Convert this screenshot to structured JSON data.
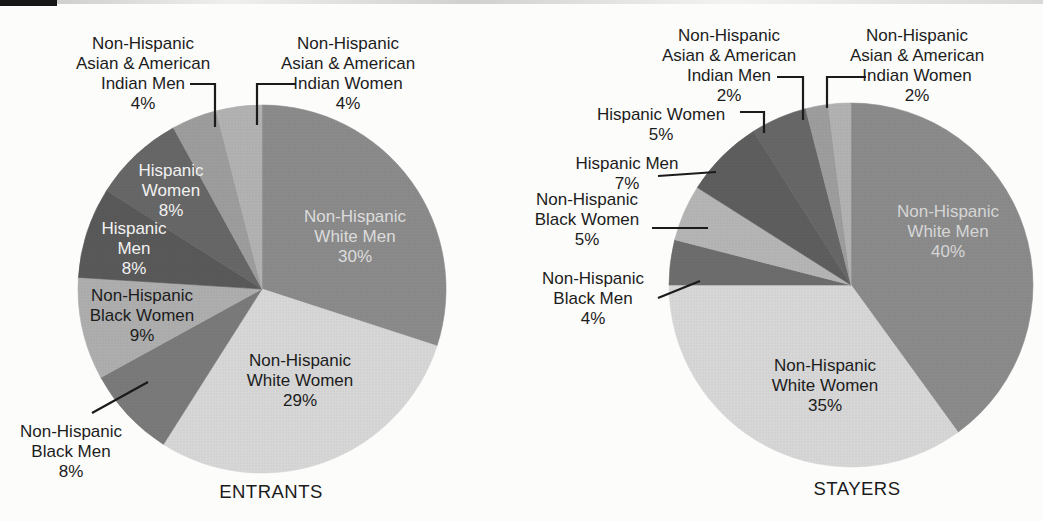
{
  "figure": {
    "description_visible_text_only": true,
    "background_color": "#fcfcfb",
    "scan_artifacts": {
      "top_left_black_bar_color": "#161616",
      "top_streak_color": "#aaaaaa"
    }
  },
  "chart_data": [
    {
      "type": "pie",
      "caption": "ENTRANTS",
      "legend": "none",
      "layout": {
        "center_x": 262,
        "center_y": 289,
        "radius": 184,
        "start_angle": 0,
        "direction": "clockwise",
        "caption_x": 271,
        "caption_y": 492
      },
      "slices": [
        {
          "category": "Non-Hispanic White Men",
          "value": 30,
          "color": "#8b8b8b",
          "label_lines": [
            "Non-Hispanic",
            "White Men",
            "30%"
          ],
          "label": {
            "placement": "inside",
            "x": 355,
            "y": 237,
            "color": "#dcdcdc"
          }
        },
        {
          "category": "Non-Hispanic White Women",
          "value": 29,
          "color": "#d7d7d7",
          "label_lines": [
            "Non-Hispanic",
            "White Women",
            "29%"
          ],
          "label": {
            "placement": "inside",
            "x": 300,
            "y": 381,
            "color": "#1c1c1c"
          }
        },
        {
          "category": "Non-Hispanic Black Men",
          "value": 8,
          "color": "#7a7a7a",
          "label_lines": [
            "Non-Hispanic",
            "Black Men",
            "8%"
          ],
          "label": {
            "placement": "outside",
            "x": 71,
            "y": 452,
            "color": "#1c1c1c"
          },
          "leader": [
            [
              92,
              413
            ],
            [
              148,
              382
            ]
          ]
        },
        {
          "category": "Non-Hispanic Black Women",
          "value": 9,
          "color": "#aeaeae",
          "label_lines": [
            "Non-Hispanic",
            "Black Women",
            "9%"
          ],
          "label": {
            "placement": "inside",
            "x": 142,
            "y": 316,
            "color": "#1c1c1c"
          }
        },
        {
          "category": "Hispanic Men",
          "value": 8,
          "color": "#595959",
          "label_lines": [
            "Hispanic",
            "Men",
            "8%"
          ],
          "label": {
            "placement": "inside",
            "x": 134,
            "y": 249,
            "color": "#f2f2f2"
          }
        },
        {
          "category": "Hispanic Women",
          "value": 8,
          "color": "#676767",
          "label_lines": [
            "Hispanic",
            "Women",
            "8%"
          ],
          "label": {
            "placement": "inside",
            "x": 171,
            "y": 191,
            "color": "#f2f2f2"
          }
        },
        {
          "category": "Non-Hispanic Asian & American Indian Men",
          "value": 4,
          "color": "#9d9d9d",
          "label_lines": [
            "Non-Hispanic",
            "Asian & American",
            "Indian Men",
            "4%"
          ],
          "label": {
            "placement": "outside",
            "x": 143,
            "y": 74,
            "color": "#1c1c1c"
          },
          "leader": [
            [
              190,
              84
            ],
            [
              215,
              84
            ],
            [
              215,
              127
            ]
          ]
        },
        {
          "category": "Non-Hispanic Asian & American Indian Women",
          "value": 4,
          "color": "#b2b2b2",
          "label_lines": [
            "Non-Hispanic",
            "Asian & American",
            "Indian Women",
            "4%"
          ],
          "label": {
            "placement": "outside",
            "x": 348,
            "y": 74,
            "color": "#1c1c1c"
          },
          "leader": [
            [
              296,
              84
            ],
            [
              257,
              84
            ],
            [
              257,
              125
            ]
          ]
        }
      ]
    },
    {
      "type": "pie",
      "caption": "STAYERS",
      "legend": "none",
      "layout": {
        "center_x": 851,
        "center_y": 285,
        "radius": 182,
        "start_angle": 0,
        "direction": "clockwise",
        "caption_x": 857,
        "caption_y": 489
      },
      "slices": [
        {
          "category": "Non-Hispanic White Men",
          "value": 40,
          "color": "#8b8b8b",
          "label_lines": [
            "Non-Hispanic",
            "White Men",
            "40%"
          ],
          "label": {
            "placement": "inside",
            "x": 948,
            "y": 232,
            "color": "#d6d6d6"
          }
        },
        {
          "category": "Non-Hispanic White Women",
          "value": 35,
          "color": "#d7d7d7",
          "label_lines": [
            "Non-Hispanic",
            "White Women",
            "35%"
          ],
          "label": {
            "placement": "inside",
            "x": 825,
            "y": 386,
            "color": "#1c1c1c"
          }
        },
        {
          "category": "Non-Hispanic Black Men",
          "value": 4,
          "color": "#6d6d6d",
          "label_lines": [
            "Non-Hispanic",
            "Black Men",
            "4%"
          ],
          "label": {
            "placement": "outside",
            "x": 593,
            "y": 299,
            "color": "#1c1c1c"
          },
          "leader": [
            [
              658,
              298
            ],
            [
              700,
              281
            ]
          ]
        },
        {
          "category": "Non-Hispanic Black Women",
          "value": 5,
          "color": "#b5b5b5",
          "label_lines": [
            "Non-Hispanic",
            "Black Women",
            "5%"
          ],
          "label": {
            "placement": "outside",
            "x": 587,
            "y": 220,
            "color": "#1c1c1c"
          },
          "leader": [
            [
              652,
              228
            ],
            [
              708,
              228
            ]
          ]
        },
        {
          "category": "Hispanic Men",
          "value": 7,
          "color": "#5e5e5e",
          "label_lines": [
            "Hispanic Men",
            "7%"
          ],
          "label": {
            "placement": "outside",
            "x": 627,
            "y": 174,
            "color": "#1c1c1c"
          },
          "leader": [
            [
              658,
              176
            ],
            [
              716,
              172
            ]
          ]
        },
        {
          "category": "Hispanic Women",
          "value": 5,
          "color": "#676767",
          "label_lines": [
            "Hispanic Women",
            "5%"
          ],
          "label": {
            "placement": "outside",
            "x": 661,
            "y": 125,
            "color": "#1c1c1c"
          },
          "leader": [
            [
              740,
              112
            ],
            [
              764,
              112
            ],
            [
              764,
              133
            ]
          ]
        },
        {
          "category": "Non-Hispanic Asian & American Indian Men",
          "value": 2,
          "color": "#9d9d9d",
          "label_lines": [
            "Non-Hispanic",
            "Asian & American",
            "Indian Men",
            "2%"
          ],
          "label": {
            "placement": "outside",
            "x": 729,
            "y": 66,
            "color": "#1c1c1c"
          },
          "leader": [
            [
              777,
              77
            ],
            [
              803,
              77
            ],
            [
              803,
              120
            ]
          ]
        },
        {
          "category": "Non-Hispanic Asian & American Indian Women",
          "value": 2,
          "color": "#b2b2b2",
          "label_lines": [
            "Non-Hispanic",
            "Asian & American",
            "Indian Women",
            "2%"
          ],
          "label": {
            "placement": "outside",
            "x": 917,
            "y": 66,
            "color": "#1c1c1c"
          },
          "leader": [
            [
              866,
              77
            ],
            [
              827,
              77
            ],
            [
              827,
              108
            ]
          ]
        }
      ]
    }
  ]
}
